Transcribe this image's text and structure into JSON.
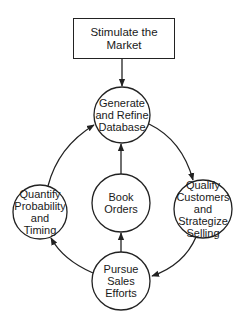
{
  "diagram": {
    "top_box": {
      "line1": "Stimulate the",
      "line2": "Market"
    },
    "nodes": {
      "generate": {
        "lines": [
          "Generate",
          "and Refine",
          "Database"
        ]
      },
      "quantify": {
        "lines": [
          "Quantify",
          "Probability",
          "and",
          "Timing"
        ]
      },
      "book": {
        "lines": [
          "Book",
          "Orders"
        ]
      },
      "qualify": {
        "lines": [
          "Qualify",
          "Customers",
          "and",
          "Strategize",
          "Selling"
        ]
      },
      "pursue": {
        "lines": [
          "Pursue",
          "Sales",
          "Efforts"
        ]
      }
    },
    "edges": [
      {
        "from": "Stimulate the Market",
        "to": "Generate and Refine Database"
      },
      {
        "from": "Generate and Refine Database",
        "to": "Qualify Customers and Strategize Selling"
      },
      {
        "from": "Qualify Customers and Strategize Selling",
        "to": "Pursue Sales Efforts"
      },
      {
        "from": "Pursue Sales Efforts",
        "to": "Quantify Probability and Timing"
      },
      {
        "from": "Pursue Sales Efforts",
        "to": "Book Orders"
      },
      {
        "from": "Quantify Probability and Timing",
        "to": "Generate and Refine Database"
      },
      {
        "from": "Book Orders",
        "to": "Generate and Refine Database"
      }
    ],
    "colors": {
      "stroke": "#222222",
      "background": "#ffffff"
    }
  }
}
